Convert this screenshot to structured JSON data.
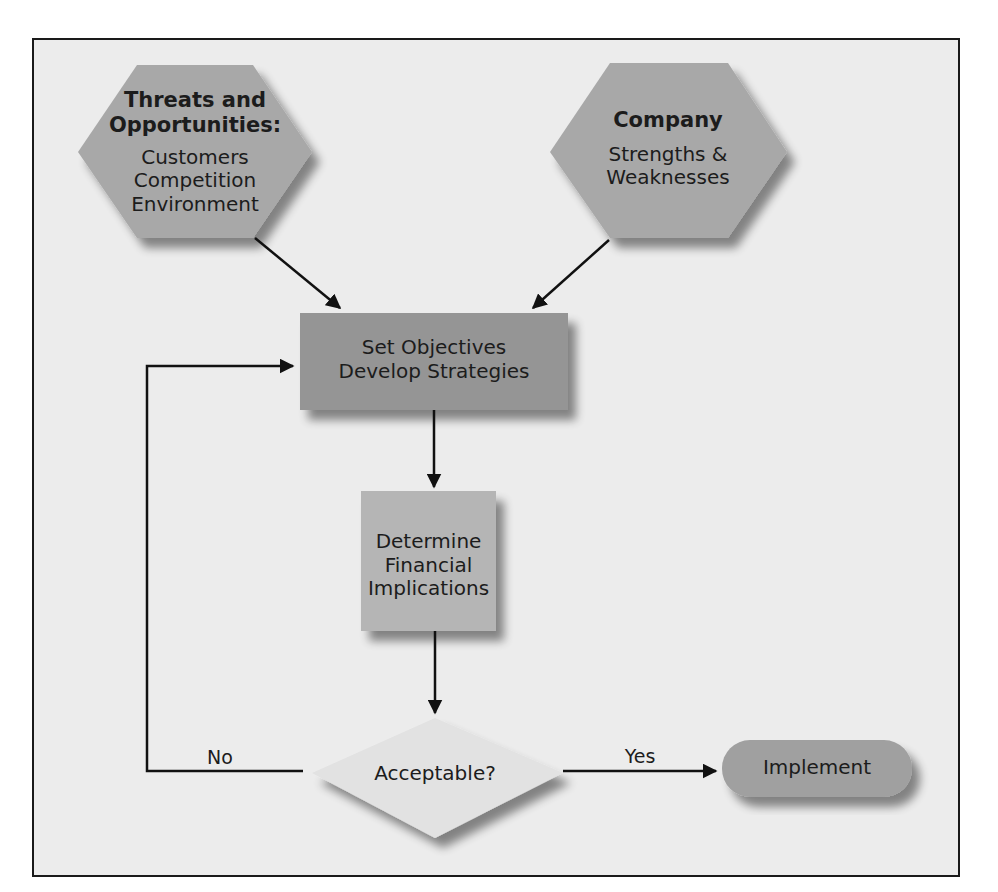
{
  "diagram": {
    "type": "flowchart",
    "colors": {
      "background": "#ececec",
      "frame": "#1a1a1a",
      "hexagon_fill": "#a8a8a8",
      "objectives_fill": "#959595",
      "financial_fill": "#b5b5b5",
      "decision_fill": "#e2e2e2",
      "implement_fill": "#a0a0a0",
      "arrow": "#111111"
    },
    "nodes": {
      "threats": {
        "shape": "hexagon",
        "title_line1": "Threats and",
        "title_line2": "Opportunities:",
        "items": [
          "Customers",
          "Competition",
          "Environment"
        ]
      },
      "company": {
        "shape": "hexagon",
        "title": "Company",
        "items": [
          "Strengths &",
          "Weaknesses"
        ]
      },
      "objectives": {
        "shape": "rectangle",
        "lines": [
          "Set Objectives",
          "Develop Strategies"
        ]
      },
      "financial": {
        "shape": "rectangle",
        "lines": [
          "Determine",
          "Financial",
          "Implications"
        ]
      },
      "decision": {
        "shape": "diamond",
        "label": "Acceptable?"
      },
      "implement": {
        "shape": "rounded-rectangle",
        "label": "Implement"
      }
    },
    "edges": [
      {
        "from": "threats",
        "to": "objectives",
        "label": ""
      },
      {
        "from": "company",
        "to": "objectives",
        "label": ""
      },
      {
        "from": "objectives",
        "to": "financial",
        "label": ""
      },
      {
        "from": "financial",
        "to": "decision",
        "label": ""
      },
      {
        "from": "decision",
        "to": "objectives",
        "label": "No"
      },
      {
        "from": "decision",
        "to": "implement",
        "label": "Yes"
      }
    ]
  }
}
